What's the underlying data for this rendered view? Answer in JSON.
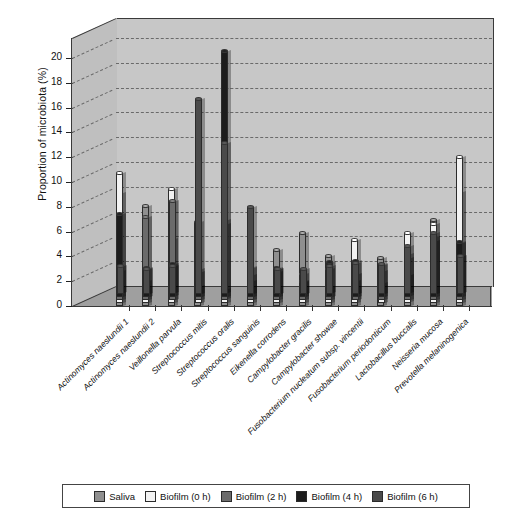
{
  "chart_data": {
    "type": "bar",
    "title": "",
    "xlabel": "",
    "ylabel": "Proportion of microbiota (%)",
    "ylim": [
      0,
      20
    ],
    "ytick_step": 2,
    "yticks": [
      "0",
      "2",
      "4",
      "6",
      "8",
      "10",
      "12",
      "14",
      "16",
      "18",
      "20"
    ],
    "grid": true,
    "legend_position": "bottom",
    "projection": "3d-grouped-cylinder",
    "categories": [
      "Actinomyces naeslundii 1",
      "Actinomyces naeslundii 2",
      "Veillonella parvula",
      "Streptococcus mitis",
      "Streptococcus oralis",
      "Streptococcus sanguinis",
      "Eikenella corrodens",
      "Campylobacter gracilis",
      "Campylobacter showae",
      "Fusobacterium nucleatum subsp. vincentii",
      "Fusobacterium periodonticum",
      "Lactobacillus buccalis",
      "Neisseria mucosa",
      "Prevotella melaninogenica"
    ],
    "series": [
      {
        "name": "Saliva",
        "color": "#8f8f8f",
        "values": [
          9.1,
          8.1,
          5.4,
          6.8,
          6.6,
          2.5,
          4.5,
          5.9,
          4.0,
          2.0,
          3.9,
          4.2,
          6.9,
          9.2
        ]
      },
      {
        "name": "Biofilm (0 h)",
        "color": "#f2f2f2",
        "values": [
          10.5,
          1.8,
          9.2,
          1.4,
          1.1,
          1.8,
          2.5,
          2.3,
          1.3,
          5.1,
          1.6,
          5.6,
          6.4,
          11.8
        ]
      },
      {
        "name": "Biofilm (2 h)",
        "color": "#6b6b6b",
        "values": [
          2.3,
          6.7,
          8.0,
          2.5,
          6.4,
          2.6,
          2.5,
          1.5,
          2.5,
          2.1,
          2.8,
          2.0,
          5.1,
          4.6
        ]
      },
      {
        "name": "Biofilm (4 h)",
        "color": "#1c1c1c",
        "values": [
          6.7,
          2.3,
          2.6,
          2.0,
          19.8,
          2.4,
          2.3,
          1.2,
          2.8,
          2.9,
          2.1,
          3.1,
          4.5,
          4.4
        ]
      },
      {
        "name": "Biofilm (6 h)",
        "color": "#4a4a4a",
        "values": [
          2.2,
          2.0,
          2.2,
          15.7,
          12.1,
          7.0,
          2.0,
          2.0,
          2.2,
          2.5,
          2.4,
          3.8,
          4.9,
          3.0
        ]
      }
    ]
  },
  "legend": {
    "items": [
      {
        "label": "Saliva",
        "color": "#8f8f8f"
      },
      {
        "label": "Biofilm (0 h)",
        "color": "#f2f2f2"
      },
      {
        "label": "Biofilm (2 h)",
        "color": "#6b6b6b"
      },
      {
        "label": "Biofilm (4 h)",
        "color": "#1c1c1c"
      },
      {
        "label": "Biofilm (6 h)",
        "color": "#4a4a4a"
      }
    ]
  }
}
